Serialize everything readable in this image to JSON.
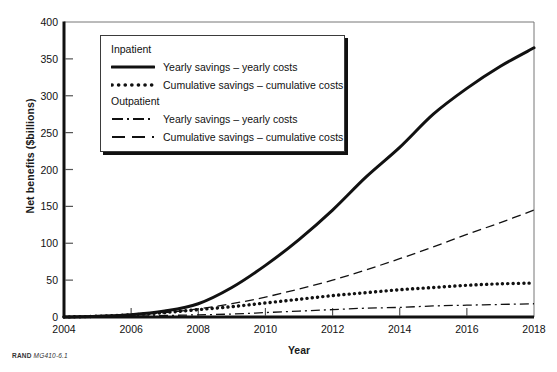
{
  "figure": {
    "credit_prefix": "RAND",
    "credit_id": "MG410-6.1"
  },
  "chart_data": {
    "type": "line",
    "title": "",
    "xlabel": "Year",
    "ylabel": "Net benefits ($billions)",
    "xlim": [
      2004,
      2018
    ],
    "ylim": [
      0,
      400
    ],
    "grid": false,
    "legend_position": "upper-left-inside",
    "xticks": [
      2004,
      2006,
      2008,
      2010,
      2012,
      2014,
      2016,
      2018
    ],
    "yticks": [
      0,
      50,
      100,
      150,
      200,
      250,
      300,
      350,
      400
    ],
    "x": [
      2004,
      2005,
      2006,
      2007,
      2008,
      2009,
      2010,
      2011,
      2012,
      2013,
      2014,
      2015,
      2016,
      2017,
      2018
    ],
    "legend_groups": [
      {
        "group_label": "Inpatient",
        "entries": [
          {
            "label": "Yearly savings – yearly costs",
            "style": "solid",
            "series": "inpatient_yearly"
          },
          {
            "label": "Cumulative savings – cumulative costs",
            "style": "dotted",
            "series": "inpatient_cumulative"
          }
        ]
      },
      {
        "group_label": "Outpatient",
        "entries": [
          {
            "label": "Yearly savings – yearly costs",
            "style": "dashdot",
            "series": "outpatient_yearly"
          },
          {
            "label": "Cumulative savings – cumulative costs",
            "style": "dashed",
            "series": "outpatient_cumulative"
          }
        ]
      }
    ],
    "series": [
      {
        "name": "Inpatient: Yearly savings – yearly costs",
        "key": "inpatient_yearly",
        "style": "solid",
        "values": [
          0,
          1,
          3,
          8,
          18,
          40,
          70,
          105,
          145,
          190,
          230,
          275,
          310,
          340,
          365
        ]
      },
      {
        "name": "Inpatient: Cumulative savings – cumulative costs",
        "key": "inpatient_cumulative",
        "style": "dotted",
        "values": [
          0,
          1,
          3,
          6,
          10,
          14,
          19,
          24,
          29,
          33,
          37,
          40,
          43,
          45,
          46
        ]
      },
      {
        "name": "Outpatient: Yearly savings – yearly costs",
        "key": "outpatient_yearly",
        "style": "dashdot",
        "values": [
          0,
          0,
          1,
          2,
          3,
          4,
          6,
          8,
          10,
          12,
          13,
          15,
          16,
          17,
          18
        ]
      },
      {
        "name": "Outpatient: Cumulative savings – cumulative costs",
        "key": "outpatient_cumulative",
        "style": "dashed",
        "values": [
          0,
          1,
          3,
          6,
          11,
          18,
          27,
          38,
          50,
          64,
          79,
          95,
          112,
          128,
          145
        ]
      }
    ]
  }
}
